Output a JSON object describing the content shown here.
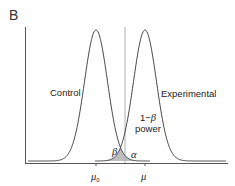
{
  "panel": {
    "label": "B"
  },
  "curves": {
    "control": {
      "label": "Control",
      "mean_label": "μ",
      "mean_subscript": "0"
    },
    "experimental": {
      "label": "Experimental",
      "mean_label": "μ"
    }
  },
  "annotations": {
    "power_line1": "1−",
    "power_beta": "β",
    "power_line2": "power",
    "beta": "β",
    "alpha": "α"
  },
  "colors": {
    "curve": "#333333",
    "axis": "#555555",
    "critical_line": "#aaaaaa",
    "shade": "#bdbdbd"
  }
}
